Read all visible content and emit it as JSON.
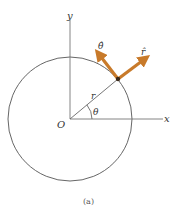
{
  "figure": {
    "caption": "(a)",
    "labels": {
      "y_axis": "y",
      "x_axis": "x",
      "origin": "O",
      "radius": "r",
      "angle": "θ",
      "r_hat": "r̂",
      "theta_hat": "θ̂"
    },
    "colors": {
      "line": "#555555",
      "arrow": "#c87a2a",
      "point": "#3a2a1a"
    },
    "geometry": {
      "center": [
        70,
        119
      ],
      "radius": 62,
      "angle_deg": 40
    }
  }
}
